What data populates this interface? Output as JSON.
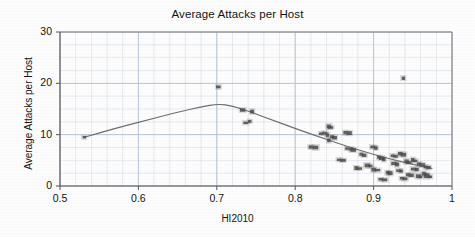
{
  "chart_data": {
    "type": "scatter",
    "title": "Average Attacks per Host",
    "xlabel": "HI2010",
    "ylabel": "Average Attacks per Host",
    "xlim": [
      0.5,
      1.0
    ],
    "ylim": [
      0,
      30
    ],
    "xticks": [
      "0.5",
      "0.6",
      "0.7",
      "0.8",
      "0.9",
      "1"
    ],
    "xtick_values": [
      0.5,
      0.6,
      0.7,
      0.8,
      0.9,
      1.0
    ],
    "yticks": [
      "0",
      "10",
      "20",
      "30"
    ],
    "ytick_values": [
      0,
      10,
      20,
      30
    ],
    "grid": true,
    "grid_minor_x": 0.02,
    "grid_minor_y": 2.5,
    "legend": null,
    "marker_color": "#4a4a4a",
    "trend_color": "#6e6e6e",
    "grid_color": "#c8d4e2",
    "axis_color": "#808080",
    "series": [
      {
        "name": "Average Attacks per Host",
        "marker": "square",
        "points": [
          [
            0.531,
            9.5
          ],
          [
            0.702,
            19.3
          ],
          [
            0.733,
            14.8
          ],
          [
            0.745,
            14.5
          ],
          [
            0.737,
            12.3
          ],
          [
            0.742,
            12.6
          ],
          [
            0.82,
            7.6
          ],
          [
            0.826,
            7.5
          ],
          [
            0.833,
            10.2
          ],
          [
            0.838,
            10.3
          ],
          [
            0.841,
            9.9
          ],
          [
            0.843,
            11.6
          ],
          [
            0.845,
            11.4
          ],
          [
            0.847,
            9.6
          ],
          [
            0.85,
            9.4
          ],
          [
            0.843,
            8.9
          ],
          [
            0.856,
            5.1
          ],
          [
            0.861,
            5.0
          ],
          [
            0.864,
            10.4
          ],
          [
            0.869,
            10.3
          ],
          [
            0.866,
            7.3
          ],
          [
            0.871,
            7.2
          ],
          [
            0.874,
            7.0
          ],
          [
            0.878,
            3.5
          ],
          [
            0.882,
            3.4
          ],
          [
            0.884,
            6.2
          ],
          [
            0.888,
            6.0
          ],
          [
            0.892,
            4.0
          ],
          [
            0.896,
            3.9
          ],
          [
            0.899,
            7.6
          ],
          [
            0.903,
            7.4
          ],
          [
            0.9,
            3.2
          ],
          [
            0.905,
            3.1
          ],
          [
            0.907,
            5.6
          ],
          [
            0.91,
            5.4
          ],
          [
            0.913,
            5.2
          ],
          [
            0.909,
            1.3
          ],
          [
            0.914,
            1.2
          ],
          [
            0.918,
            2.6
          ],
          [
            0.921,
            2.5
          ],
          [
            0.924,
            5.9
          ],
          [
            0.928,
            5.8
          ],
          [
            0.926,
            4.4
          ],
          [
            0.93,
            4.2
          ],
          [
            0.932,
            3.0
          ],
          [
            0.935,
            2.9
          ],
          [
            0.934,
            6.3
          ],
          [
            0.938,
            6.1
          ],
          [
            0.936,
            1.5
          ],
          [
            0.94,
            1.4
          ],
          [
            0.938,
            21.0
          ],
          [
            0.942,
            4.8
          ],
          [
            0.945,
            4.6
          ],
          [
            0.944,
            2.2
          ],
          [
            0.948,
            2.1
          ],
          [
            0.95,
            5.1
          ],
          [
            0.953,
            4.9
          ],
          [
            0.951,
            3.3
          ],
          [
            0.955,
            3.2
          ],
          [
            0.957,
            1.9
          ],
          [
            0.96,
            1.8
          ],
          [
            0.958,
            4.3
          ],
          [
            0.962,
            4.1
          ],
          [
            0.964,
            2.4
          ],
          [
            0.967,
            2.3
          ],
          [
            0.966,
            3.7
          ],
          [
            0.97,
            3.6
          ],
          [
            0.968,
            1.9
          ],
          [
            0.972,
            1.8
          ]
        ]
      }
    ],
    "trendline": {
      "name": "fitted trend",
      "points": [
        [
          0.531,
          9.5
        ],
        [
          0.57,
          11.2
        ],
        [
          0.61,
          12.8
        ],
        [
          0.65,
          14.4
        ],
        [
          0.68,
          15.4
        ],
        [
          0.702,
          16.0
        ],
        [
          0.72,
          15.6
        ],
        [
          0.74,
          14.6
        ],
        [
          0.77,
          12.9
        ],
        [
          0.8,
          11.2
        ],
        [
          0.83,
          9.6
        ],
        [
          0.86,
          8.0
        ],
        [
          0.89,
          6.6
        ],
        [
          0.92,
          5.3
        ],
        [
          0.95,
          4.2
        ],
        [
          0.975,
          3.4
        ]
      ]
    }
  }
}
